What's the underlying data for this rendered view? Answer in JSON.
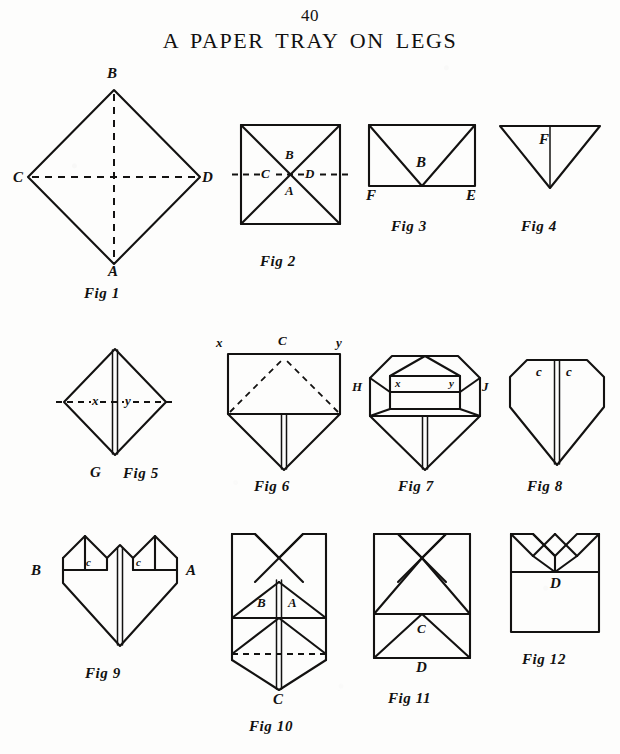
{
  "page": {
    "number": "40",
    "title": "A PAPER TRAY ON LEGS",
    "ink_color": "#131211",
    "paper_color": "#fdfdfc"
  },
  "figures": [
    {
      "id": "fig1",
      "caption": "Fig 1",
      "shape": "diamond-with-dashed-diagonals",
      "labels": [
        {
          "text": "B",
          "position": "top"
        },
        {
          "text": "C",
          "position": "left"
        },
        {
          "text": "D",
          "position": "right"
        },
        {
          "text": "A",
          "position": "bottom"
        }
      ]
    },
    {
      "id": "fig2",
      "caption": "Fig 2",
      "shape": "square-with-diagonals-and-dashed-horizontal",
      "labels": [
        {
          "text": "B",
          "position": "center-above"
        },
        {
          "text": "C",
          "position": "center-left"
        },
        {
          "text": "D",
          "position": "center-right"
        },
        {
          "text": "A",
          "position": "center-below"
        }
      ]
    },
    {
      "id": "fig3",
      "caption": "Fig 3",
      "shape": "rectangle-with-two-diagonals-to-bottom-center",
      "labels": [
        {
          "text": "B",
          "position": "center"
        },
        {
          "text": "F",
          "position": "bottom-left"
        },
        {
          "text": "E",
          "position": "bottom-right"
        }
      ]
    },
    {
      "id": "fig4",
      "caption": "Fig 4",
      "shape": "downward-triangle-with-center-line",
      "labels": [
        {
          "text": "F",
          "position": "upper-center"
        }
      ]
    },
    {
      "id": "fig5",
      "caption": "Fig 5",
      "shape": "diamond-with-center-double-line-and-dashed-horizontal",
      "labels": [
        {
          "text": "x",
          "position": "center-left"
        },
        {
          "text": "y",
          "position": "center-right"
        },
        {
          "text": "G",
          "position": "bottom-left"
        }
      ]
    },
    {
      "id": "fig6",
      "caption": "Fig 6",
      "shape": "rectangle-with-dashed-triangle-over-point-flap",
      "labels": [
        {
          "text": "x",
          "position": "top-left"
        },
        {
          "text": "C",
          "position": "top-center"
        },
        {
          "text": "y",
          "position": "top-right"
        }
      ]
    },
    {
      "id": "fig7",
      "caption": "Fig 7",
      "shape": "octagon-top-with-inner-rectangle-and-triangle-over-point-flap",
      "labels": [
        {
          "text": "H",
          "position": "left"
        },
        {
          "text": "J",
          "position": "right"
        },
        {
          "text": "x",
          "position": "inner-left"
        },
        {
          "text": "y",
          "position": "inner-right"
        }
      ]
    },
    {
      "id": "fig8",
      "caption": "Fig 8",
      "shape": "shield-with-center-double-line",
      "labels": [
        {
          "text": "c",
          "position": "top-left-of-center"
        },
        {
          "text": "c",
          "position": "top-right-of-center"
        }
      ]
    },
    {
      "id": "fig9",
      "caption": "Fig 9",
      "shape": "heart-with-two-triangular-flaps",
      "labels": [
        {
          "text": "c",
          "position": "left-flap"
        },
        {
          "text": "c",
          "position": "right-flap"
        },
        {
          "text": "B",
          "position": "left"
        },
        {
          "text": "A",
          "position": "right"
        }
      ]
    },
    {
      "id": "fig10",
      "caption": "Fig 10",
      "shape": "tall-form-with-crossed-top-flaps-and-dashed-fold-line",
      "labels": [
        {
          "text": "B",
          "position": "center-left"
        },
        {
          "text": "A",
          "position": "center-right"
        },
        {
          "text": "C",
          "position": "bottom"
        }
      ]
    },
    {
      "id": "fig11",
      "caption": "Fig 11",
      "shape": "rectangle-with-crossed-top-flaps-and-lower-triangle",
      "labels": [
        {
          "text": "C",
          "position": "lower-center"
        },
        {
          "text": "D",
          "position": "bottom"
        }
      ]
    },
    {
      "id": "fig12",
      "caption": "Fig 12",
      "shape": "box-with-zigzag-crown-top",
      "labels": [
        {
          "text": "D",
          "position": "center"
        }
      ]
    }
  ]
}
